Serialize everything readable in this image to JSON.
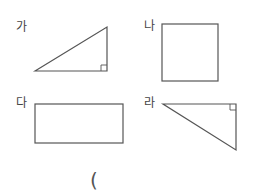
{
  "figures": [
    {
      "label": "가",
      "shape": "right-triangle",
      "right_angle": "bottom-right"
    },
    {
      "label": "나",
      "shape": "square"
    },
    {
      "label": "다",
      "shape": "rectangle"
    },
    {
      "label": "라",
      "shape": "right-triangle",
      "right_angle": "top-right"
    }
  ],
  "answer_paren": "(",
  "colors": {
    "stroke": "#555555",
    "text": "#444444"
  }
}
